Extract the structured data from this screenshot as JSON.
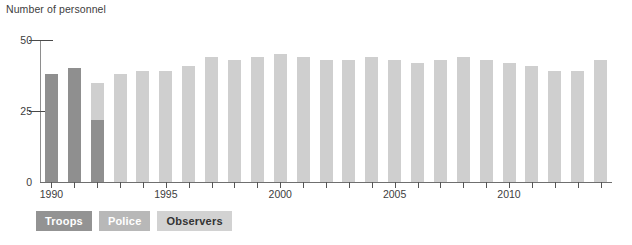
{
  "chart_data": {
    "type": "bar",
    "title": "Number of personnel",
    "xlabel": "",
    "ylabel": "Number of personnel",
    "ylim": [
      0,
      50
    ],
    "yticks": [
      0,
      25,
      50
    ],
    "ytick_labels": [
      "0",
      "25",
      "50"
    ],
    "grid": false,
    "stacked": true,
    "legend_position": "bottom-left",
    "categories": [
      "1990",
      "1991",
      "1992",
      "1993",
      "1994",
      "1995",
      "1996",
      "1997",
      "1998",
      "1999",
      "2000",
      "2001",
      "2002",
      "2003",
      "2004",
      "2005",
      "2006",
      "2007",
      "2008",
      "2009",
      "2010",
      "2011",
      "2012",
      "2013",
      "2014"
    ],
    "xtick_labels": [
      "1990",
      "1995",
      "2000",
      "2005",
      "2010"
    ],
    "xtick_categories": [
      "1990",
      "1995",
      "2000",
      "2005",
      "2010"
    ],
    "series": [
      {
        "name": "Troops",
        "color": "#8f8f8f",
        "values": [
          38,
          40,
          22,
          0,
          0,
          0,
          0,
          0,
          0,
          0,
          0,
          0,
          0,
          0,
          0,
          0,
          0,
          0,
          0,
          0,
          0,
          0,
          0,
          0,
          0
        ]
      },
      {
        "name": "Police",
        "color": "#b4b4b4",
        "values": [
          0,
          0,
          0,
          0,
          0,
          0,
          0,
          0,
          0,
          0,
          0,
          0,
          0,
          0,
          0,
          0,
          0,
          0,
          0,
          0,
          0,
          0,
          0,
          0,
          0
        ]
      },
      {
        "name": "Observers",
        "color": "#cfcfcf",
        "values": [
          0,
          0,
          13,
          38,
          39,
          39,
          41,
          44,
          43,
          44,
          45,
          44,
          43,
          43,
          44,
          43,
          42,
          43,
          44,
          43,
          42,
          41,
          39,
          39,
          43
        ]
      }
    ],
    "totals": [
      38,
      40,
      35,
      38,
      39,
      39,
      41,
      44,
      43,
      44,
      45,
      44,
      43,
      43,
      44,
      43,
      42,
      43,
      44,
      43,
      42,
      41,
      39,
      39,
      43
    ]
  },
  "legend": {
    "items": [
      {
        "label": "Troops",
        "swatch": "#939393",
        "text_color": "#ffffff"
      },
      {
        "label": "Police",
        "swatch": "#b8b8b8",
        "text_color": "#ffffff"
      },
      {
        "label": "Observers",
        "swatch": "#d2d2d2",
        "text_color": "#333333"
      }
    ]
  },
  "colors": {
    "axis": "#6f6f6f",
    "text": "#404040",
    "background": "#ffffff"
  }
}
